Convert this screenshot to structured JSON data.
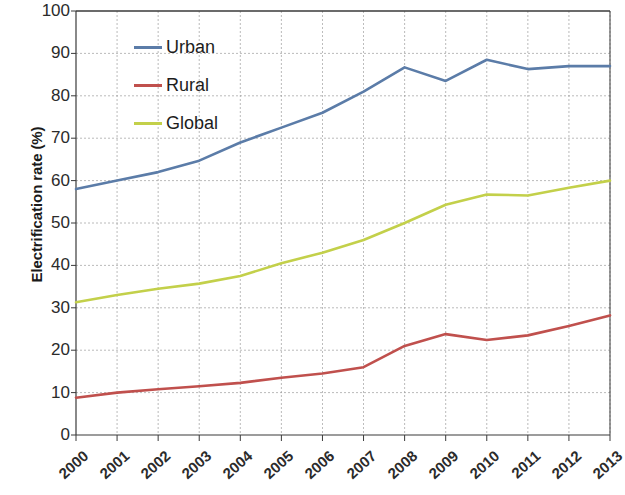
{
  "chart_data": {
    "type": "line",
    "title": "",
    "xlabel": "",
    "ylabel": "Electrification rate (%)",
    "categories": [
      "2000",
      "2001",
      "2002",
      "2003",
      "2004",
      "2005",
      "2006",
      "2007",
      "2008",
      "2009",
      "2010",
      "2011",
      "2012",
      "2013"
    ],
    "x": [
      2000,
      2001,
      2002,
      2003,
      2004,
      2005,
      2006,
      2007,
      2008,
      2009,
      2010,
      2011,
      2012,
      2013
    ],
    "xlim": [
      2000,
      2013
    ],
    "ylim": [
      0,
      100
    ],
    "ytick_step": 10,
    "yticks": [
      "100",
      "90",
      "80",
      "70",
      "60",
      "50",
      "40",
      "30",
      "20",
      "10",
      "0"
    ],
    "grid": true,
    "grid_axes": "both",
    "legend_position": "upper-left-inside",
    "series": [
      {
        "name": "Urban",
        "color": "#5b7ca8",
        "values": [
          58.0,
          60.0,
          62.0,
          64.7,
          69.0,
          72.5,
          76.0,
          81.0,
          86.7,
          83.5,
          88.5,
          86.3,
          87.0,
          87.0
        ]
      },
      {
        "name": "Rural",
        "color": "#c0504d",
        "values": [
          8.8,
          10.0,
          10.8,
          11.5,
          12.3,
          13.5,
          14.5,
          16.0,
          21.0,
          23.8,
          22.4,
          23.5,
          25.7,
          28.2
        ]
      },
      {
        "name": "Global",
        "color": "#c3d04a",
        "values": [
          31.3,
          33.0,
          34.5,
          35.7,
          37.5,
          40.5,
          43.0,
          46.0,
          50.0,
          54.3,
          56.7,
          56.5,
          58.3,
          60.0
        ]
      }
    ]
  },
  "axes": {
    "y_title": "Electrification rate (%)",
    "y_tick_labels": [
      "100",
      "90",
      "80",
      "70",
      "60",
      "50",
      "40",
      "30",
      "20",
      "10",
      "0"
    ],
    "x_tick_labels": [
      "2000",
      "2001",
      "2002",
      "2003",
      "2004",
      "2005",
      "2006",
      "2007",
      "2008",
      "2009",
      "2010",
      "2011",
      "2012",
      "2013"
    ]
  },
  "legend": {
    "entries": [
      {
        "label": "Urban",
        "color": "#5b7ca8"
      },
      {
        "label": "Rural",
        "color": "#c0504d"
      },
      {
        "label": "Global",
        "color": "#c3d04a"
      }
    ]
  },
  "style": {
    "plot_background": "#ffffff",
    "grid_color": "#9a9a9a",
    "axis_color": "#3a3a3a",
    "text_color": "#2b2b2b"
  }
}
